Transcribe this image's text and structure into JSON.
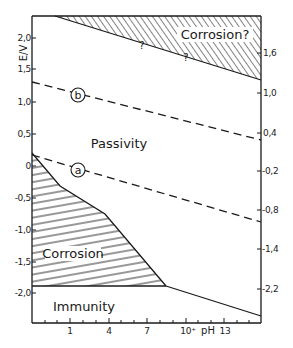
{
  "axes": {
    "left_label": "E/V",
    "left_ticks": [
      "2,0",
      "1,5",
      "1,0",
      "0,5",
      "0",
      "-0,5",
      "-1,0",
      "-1,5",
      "-2,0"
    ],
    "right_ticks": [
      "1,6",
      "1,0",
      "0,4",
      "-0,2",
      "-0,8",
      "-1,4",
      "-2,2"
    ],
    "bottom_label": "pH",
    "bottom_ticks": [
      "1",
      "4",
      "7",
      "10⁺",
      "13"
    ]
  },
  "regions": {
    "passivity": "Passivity",
    "corrosion": "Corrosion",
    "immunity": "Immunity",
    "corrosion_uncertain": "Corrosion?",
    "question_mark_1": "?",
    "question_mark_2": "?"
  },
  "lines": {
    "a_label": "a",
    "b_label": "b"
  },
  "colors": {
    "ink": "#1a1a1a",
    "background": "#ffffff"
  }
}
